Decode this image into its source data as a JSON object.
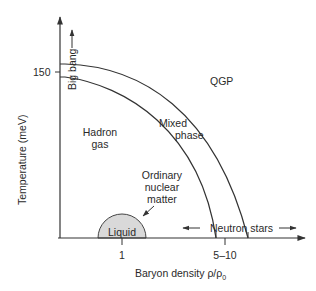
{
  "diagram": {
    "type": "phase-diagram",
    "axes": {
      "y_label": "Temperature (meV)",
      "x_label_prefix": "Baryon density ",
      "x_label_symbol": "ρ/ρ",
      "x_label_subscript": "0",
      "y_ticks": [
        {
          "value": "150"
        }
      ],
      "x_ticks": [
        {
          "value": "1"
        },
        {
          "value": "5–10"
        }
      ]
    },
    "regions": {
      "qgp": "QGP",
      "hadron_gas_line1": "Hadron",
      "hadron_gas_line2": "gas",
      "mixed_line1": "Mixed",
      "mixed_line2": "phase",
      "liquid": "Liquid"
    },
    "annotations": {
      "big_bang": "Big bang",
      "ordinary_line1": "Ordinary",
      "ordinary_line2": "nuclear",
      "ordinary_line3": "matter",
      "neutron_stars": "Neutron stars"
    },
    "colors": {
      "line": "#333333",
      "liquid_fill": "#d9d9d9",
      "background": "#ffffff"
    }
  }
}
